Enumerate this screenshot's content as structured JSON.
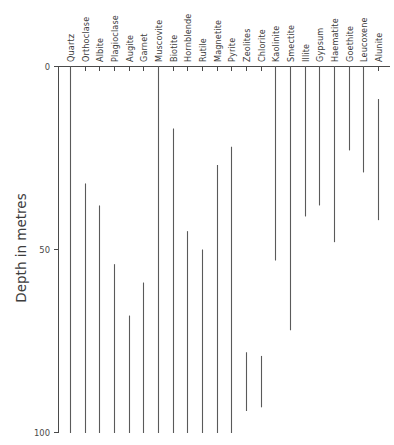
{
  "chart_data": {
    "type": "bar",
    "orientation": "vertical-range",
    "title": "",
    "subtitle": "",
    "xlabel": "",
    "ylabel": "Depth in metres",
    "ylim": [
      0,
      100
    ],
    "y_inverted": true,
    "grid": false,
    "legend": null,
    "y_ticks": [
      0,
      50,
      100
    ],
    "y_tick_labels": [
      "0",
      "50",
      "100"
    ],
    "categories": [
      "Quartz",
      "Orthoclase",
      "Albite",
      "Plagioclase",
      "Augite",
      "Garnet",
      "Muscovite",
      "Biotite",
      "Hornblende",
      "Rutile",
      "Magnetite",
      "Pyrite",
      "Zeolites",
      "Chlorite",
      "Kaolinite",
      "Smectite",
      "Illite",
      "Gypsum",
      "Haematite",
      "Goethite",
      "Leucoxene",
      "Alunite"
    ],
    "series": [
      {
        "name": "Depth range (metres)",
        "ranges": [
          {
            "category": "Quartz",
            "top": 0,
            "bottom": 100
          },
          {
            "category": "Orthoclase",
            "top": 32,
            "bottom": 100
          },
          {
            "category": "Albite",
            "top": 38,
            "bottom": 100
          },
          {
            "category": "Plagioclase",
            "top": 54,
            "bottom": 100
          },
          {
            "category": "Augite",
            "top": 68,
            "bottom": 100
          },
          {
            "category": "Garnet",
            "top": 59,
            "bottom": 100
          },
          {
            "category": "Muscovite",
            "top": 0,
            "bottom": 100
          },
          {
            "category": "Biotite",
            "top": 17,
            "bottom": 100
          },
          {
            "category": "Hornblende",
            "top": 45,
            "bottom": 100
          },
          {
            "category": "Rutile",
            "top": 50,
            "bottom": 100
          },
          {
            "category": "Magnetite",
            "top": 27,
            "bottom": 100
          },
          {
            "category": "Pyrite",
            "top": 22,
            "bottom": 100
          },
          {
            "category": "Zeolites",
            "top": 78,
            "bottom": 94
          },
          {
            "category": "Chlorite",
            "top": 79,
            "bottom": 93
          },
          {
            "category": "Kaolinite",
            "top": 0,
            "bottom": 53
          },
          {
            "category": "Smectite",
            "top": 0,
            "bottom": 72
          },
          {
            "category": "Illite",
            "top": 0,
            "bottom": 41
          },
          {
            "category": "Gypsum",
            "top": 0,
            "bottom": 38
          },
          {
            "category": "Haematite",
            "top": 0,
            "bottom": 48
          },
          {
            "category": "Goethite",
            "top": 0,
            "bottom": 23
          },
          {
            "category": "Leucoxene",
            "top": 0,
            "bottom": 29
          },
          {
            "category": "Alunite",
            "top": 9,
            "bottom": 42
          }
        ]
      }
    ]
  },
  "axis": {
    "y_title": "Depth in metres",
    "tick_0": "0",
    "tick_50": "50",
    "tick_100": "100"
  }
}
